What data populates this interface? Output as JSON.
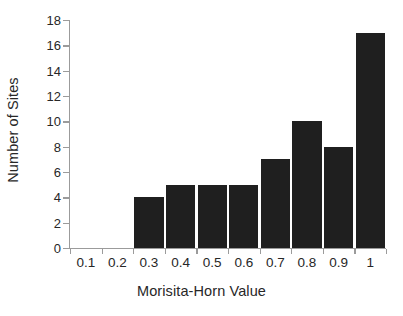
{
  "chart_data": {
    "type": "bar",
    "title": "",
    "xlabel": "Morisita-Horn Value",
    "ylabel": "Number of Sites",
    "categories": [
      "0.1",
      "0.2",
      "0.3",
      "0.4",
      "0.5",
      "0.6",
      "0.7",
      "0.8",
      "0.9",
      "1"
    ],
    "bins": [
      {
        "label": "0.1",
        "range": "0.0-0.1",
        "value": 0
      },
      {
        "label": "0.2",
        "range": "0.1-0.2",
        "value": 0
      },
      {
        "label": "0.3",
        "range": "0.2-0.3",
        "value": 4
      },
      {
        "label": "0.4",
        "range": "0.3-0.4",
        "value": 5
      },
      {
        "label": "0.5",
        "range": "0.4-0.5",
        "value": 5
      },
      {
        "label": "0.6",
        "range": "0.5-0.6",
        "value": 5
      },
      {
        "label": "0.7",
        "range": "0.6-0.7",
        "value": 7
      },
      {
        "label": "0.8",
        "range": "0.7-0.8",
        "value": 10
      },
      {
        "label": "0.9",
        "range": "0.8-0.9",
        "value": 8
      },
      {
        "label": "1",
        "range": "0.9-1.0",
        "value": 17
      }
    ],
    "values": [
      0,
      0,
      4,
      5,
      5,
      5,
      7,
      10,
      8,
      17
    ],
    "xtick_labels": [
      "0.1",
      "0.2",
      "0.3",
      "0.4",
      "0.5",
      "0.6",
      "0.7",
      "0.8",
      "0.9",
      "1"
    ],
    "ytick_labels": [
      "18",
      "16",
      "14",
      "12",
      "10",
      "8",
      "6",
      "4",
      "2",
      "0"
    ],
    "ylim": [
      0,
      18
    ],
    "ytick_step": 2,
    "grid": false,
    "legend": null,
    "bar_color": "#1f1f1f",
    "axis_color": "#9b9b9b",
    "background_color": "#ffffff"
  }
}
